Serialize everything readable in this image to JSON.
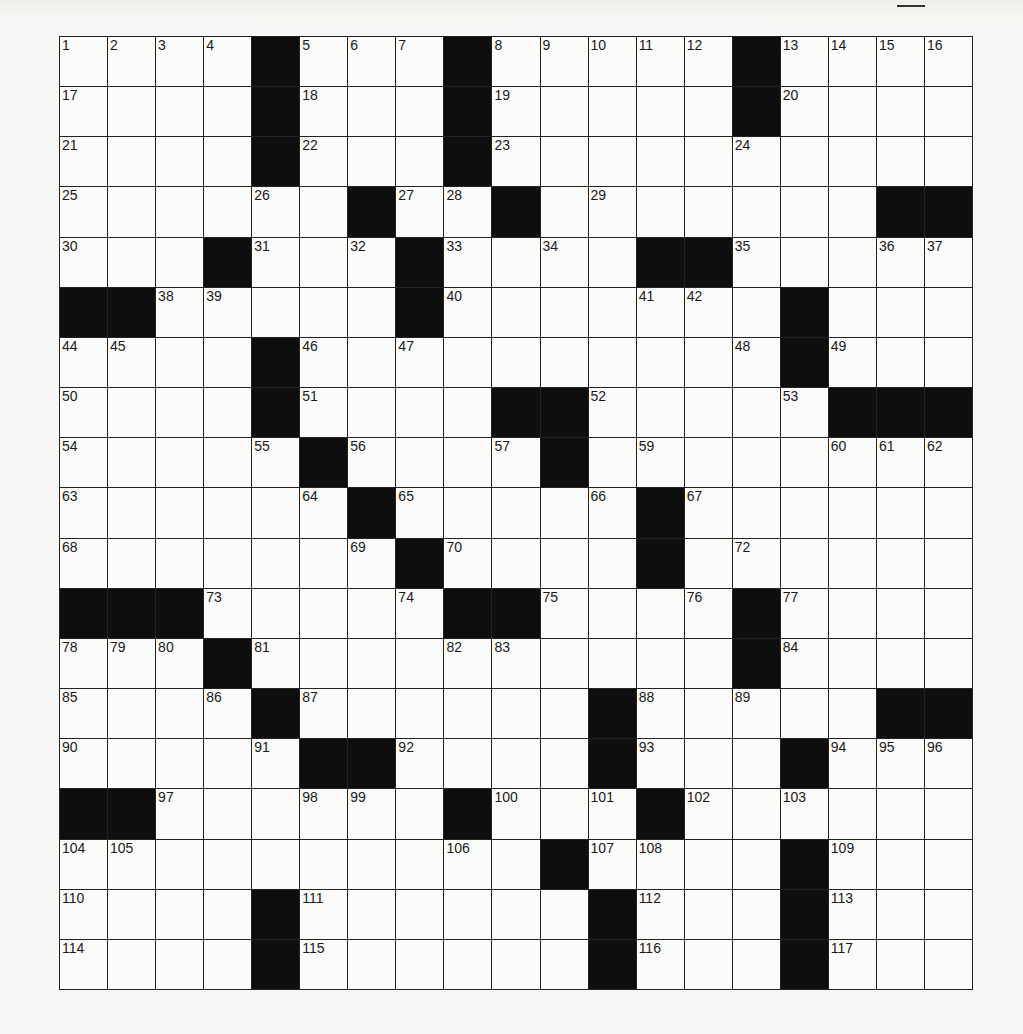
{
  "page": {
    "header_mark": "__"
  },
  "puzzle": {
    "rows": 19,
    "cols": 19,
    "grid": [
      "....#...#.....#....",
      "....#...#.....#....",
      "....#...#..........",
      "......#..#.......##",
      "...#...#....##.....",
      "##.....#.......#...",
      "....#..........#...",
      "....#....##.....###",
      ".....#....#........",
      "......#.....#......",
      ".......#....#......",
      "###.....##....#....",
      "...#..........#....",
      "....#......#.....##",
      ".....##....#...#...",
      "##......#...#......",
      "..........#....#...",
      "....#......#...#...",
      "....#......#...#..."
    ],
    "numbers": {
      "0,0": "1",
      "0,1": "2",
      "0,2": "3",
      "0,3": "4",
      "0,5": "5",
      "0,6": "6",
      "0,7": "7",
      "0,9": "8",
      "0,10": "9",
      "0,11": "10",
      "0,12": "11",
      "0,13": "12",
      "0,15": "13",
      "0,16": "14",
      "0,17": "15",
      "0,18": "16",
      "1,0": "17",
      "1,5": "18",
      "1,9": "19",
      "1,15": "20",
      "2,0": "21",
      "2,5": "22",
      "2,9": "23",
      "2,14": "24",
      "3,0": "25",
      "3,4": "26",
      "3,7": "27",
      "3,8": "28",
      "3,11": "29",
      "4,0": "30",
      "4,4": "31",
      "4,6": "32",
      "4,8": "33",
      "4,10": "34",
      "4,14": "35",
      "4,17": "36",
      "4,18": "37",
      "5,2": "38",
      "5,3": "39",
      "5,8": "40",
      "5,12": "41",
      "5,13": "42",
      "5,15": "43",
      "6,0": "44",
      "6,1": "45",
      "6,5": "46",
      "6,7": "47",
      "6,14": "48",
      "6,16": "49",
      "7,0": "50",
      "7,5": "51",
      "7,11": "52",
      "7,15": "53",
      "8,0": "54",
      "8,4": "55",
      "8,6": "56",
      "8,9": "57",
      "8,10": "58",
      "8,12": "59",
      "8,16": "60",
      "8,17": "61",
      "8,18": "62",
      "9,0": "63",
      "9,5": "64",
      "9,7": "65",
      "9,11": "66",
      "9,13": "67",
      "10,0": "68",
      "10,6": "69",
      "10,8": "70",
      "10,12": "71",
      "10,14": "72",
      "11,3": "73",
      "11,7": "74",
      "11,10": "75",
      "11,13": "76",
      "11,15": "77",
      "12,0": "78",
      "12,1": "79",
      "12,2": "80",
      "12,4": "81",
      "12,8": "82",
      "12,9": "83",
      "12,15": "84",
      "13,0": "85",
      "13,3": "86",
      "13,5": "87",
      "13,12": "88",
      "13,14": "89",
      "14,0": "90",
      "14,4": "91",
      "14,7": "92",
      "14,12": "93",
      "14,16": "94",
      "14,17": "95",
      "14,18": "96",
      "15,2": "97",
      "15,5": "98",
      "15,6": "99",
      "15,9": "100",
      "15,11": "101",
      "15,13": "102",
      "15,15": "103",
      "16,0": "104",
      "16,1": "105",
      "16,8": "106",
      "16,11": "107",
      "16,12": "108",
      "16,16": "109",
      "17,0": "110",
      "17,5": "111",
      "17,12": "112",
      "17,16": "113",
      "18,0": "114",
      "18,5": "115",
      "18,12": "116",
      "18,16": "117"
    }
  }
}
